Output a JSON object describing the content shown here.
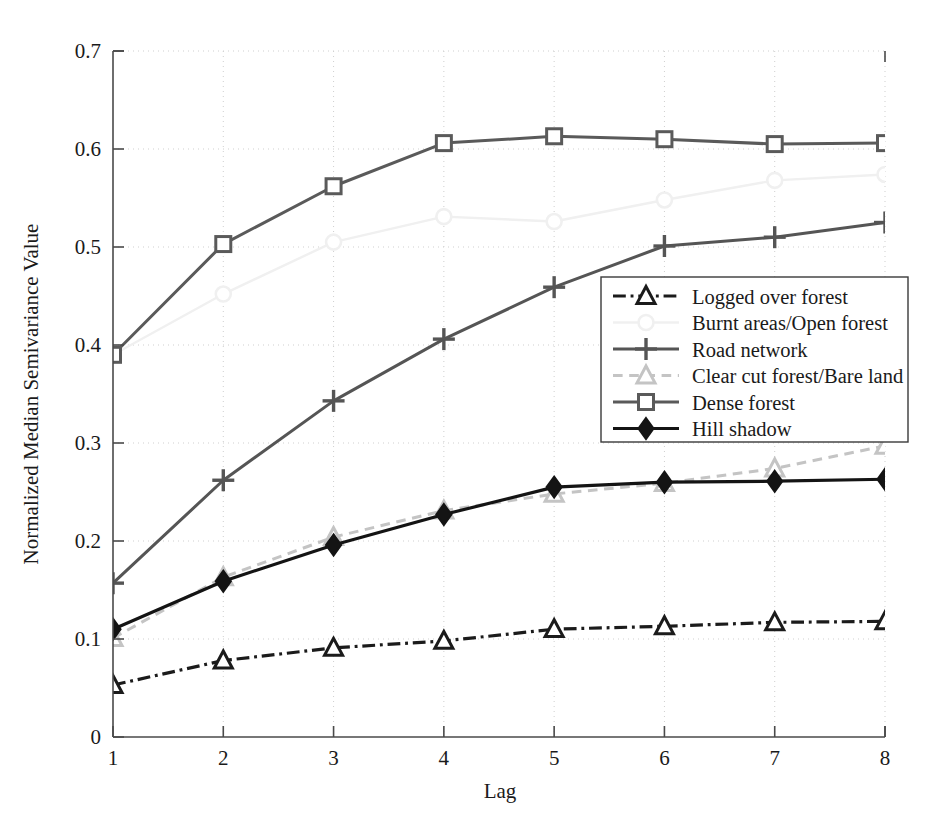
{
  "chart_data": {
    "type": "line",
    "title": "",
    "xlabel": "Lag",
    "ylabel": "Normalized Median Semivariance Value",
    "x": [
      1,
      2,
      3,
      4,
      5,
      6,
      7,
      8
    ],
    "xlim": [
      1,
      8
    ],
    "ylim": [
      0,
      0.7
    ],
    "xticks": [
      "1",
      "2",
      "3",
      "4",
      "5",
      "6",
      "7",
      "8"
    ],
    "yticks": [
      "0",
      "0.1",
      "0.2",
      "0.3",
      "0.4",
      "0.5",
      "0.6",
      "0.7"
    ],
    "ytick_values": [
      0,
      0.1,
      0.2,
      0.3,
      0.4,
      0.5,
      0.6,
      0.7
    ],
    "grid": true,
    "grid_style": "dotted",
    "legend_position": "center-right",
    "series": [
      {
        "name": "Logged over forest",
        "values": [
          0.053,
          0.078,
          0.091,
          0.098,
          0.11,
          0.113,
          0.117,
          0.118
        ],
        "color": "#1b1b1b",
        "marker": "triangle-open",
        "dash": "dashdot",
        "width": 3.2
      },
      {
        "name": "Burnt areas/Open forest",
        "values": [
          0.39,
          0.452,
          0.505,
          0.531,
          0.526,
          0.548,
          0.568,
          0.574
        ],
        "color": "#f0f0f0",
        "marker": "circle-open",
        "dash": "solid",
        "width": 2.4
      },
      {
        "name": "Road network",
        "values": [
          0.157,
          0.262,
          0.343,
          0.406,
          0.459,
          0.501,
          0.51,
          0.525
        ],
        "color": "#555555",
        "marker": "plus",
        "dash": "solid",
        "width": 3.0
      },
      {
        "name": "Clear cut forest/Bare land",
        "values": [
          0.101,
          0.163,
          0.204,
          0.231,
          0.248,
          0.259,
          0.274,
          0.297
        ],
        "color": "#c4c4c4",
        "marker": "triangle-open",
        "dash": "dashed",
        "width": 3.0
      },
      {
        "name": "Dense forest",
        "values": [
          0.39,
          0.503,
          0.562,
          0.606,
          0.613,
          0.61,
          0.605,
          0.606
        ],
        "color": "#5a5a5a",
        "marker": "square-open",
        "dash": "solid",
        "width": 3.0
      },
      {
        "name": "Hill shadow",
        "values": [
          0.11,
          0.159,
          0.196,
          0.227,
          0.255,
          0.26,
          0.261,
          0.263
        ],
        "color": "#141414",
        "marker": "diamond-filled",
        "dash": "solid",
        "width": 3.2
      }
    ]
  },
  "legend": {
    "entries": [
      {
        "label": "Logged over forest"
      },
      {
        "label": "Burnt areas/Open forest"
      },
      {
        "label": "Road network"
      },
      {
        "label": "Clear cut forest/Bare land"
      },
      {
        "label": "Dense forest"
      },
      {
        "label": "Hill shadow"
      }
    ]
  },
  "axes": {
    "x_title": "Lag",
    "y_title": "Normalized Median Semivariance Value"
  }
}
